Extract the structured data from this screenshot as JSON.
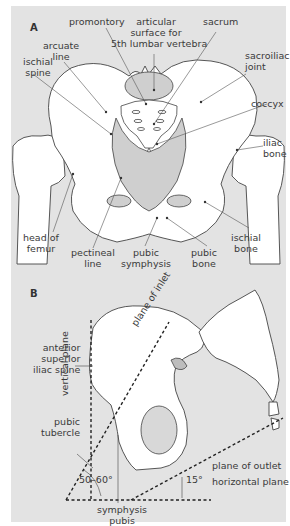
{
  "figure": {
    "panel_a": {
      "letter": "A",
      "labels": {
        "promontory": "promontory",
        "articular_1": "articular",
        "articular_2": "surface for",
        "articular_3": "5th lumbar vertebra",
        "sacrum": "sacrum",
        "arcuate_1": "arcuate",
        "arcuate_2": "line",
        "ischial_spine_1": "ischial",
        "ischial_spine_2": "spine",
        "sacroiliac_1": "sacroiliac",
        "sacroiliac_2": "joint",
        "coccyx": "coccyx",
        "iliac_1": "iliac",
        "iliac_2": "bone",
        "head_femur_1": "head of",
        "head_femur_2": "femur",
        "pectineal_1": "pectineal",
        "pectineal_2": "line",
        "pubic_symphysis_1": "pubic",
        "pubic_symphysis_2": "symphysis",
        "pubic_bone_1": "pubic",
        "pubic_bone_2": "bone",
        "ischial_bone_1": "ischial",
        "ischial_bone_2": "bone"
      }
    },
    "panel_b": {
      "letter": "B",
      "labels": {
        "asis_1": "anterior",
        "asis_2": "superior",
        "asis_3": "iliac spine",
        "vertical_plane": "vertical plane",
        "plane_inlet": "plane of inlet",
        "pubic_tubercle_1": "pubic",
        "pubic_tubercle_2": "tubercle",
        "angle_inlet": "50–60°",
        "angle_outlet": "15°",
        "plane_outlet": "plane of outlet",
        "horizontal_plane": "horizontal plane",
        "symphysis_1": "symphysis",
        "symphysis_2": "pubis"
      }
    },
    "colors": {
      "background": "#e3e3e3",
      "bone_fill": "#ffffff",
      "bone_shade": "#cfcfcf",
      "line": "#3a3a3a"
    }
  }
}
